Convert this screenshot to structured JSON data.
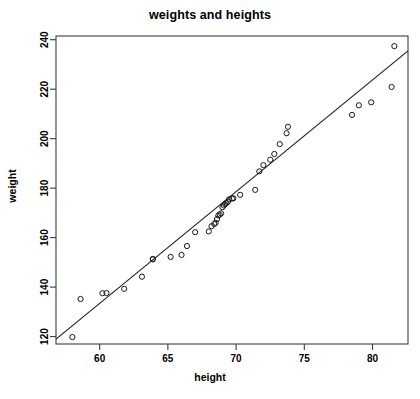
{
  "chart_data": {
    "type": "scatter",
    "title": "weights and heights",
    "xlabel": "height",
    "ylabel": "weight",
    "xlim": [
      56.8,
      82.6
    ],
    "ylim": [
      117.0,
      241.5
    ],
    "xticks": [
      60,
      65,
      70,
      75,
      80
    ],
    "xtick_labels": [
      "60",
      "65",
      "70",
      "75",
      "80"
    ],
    "yticks": [
      120,
      140,
      160,
      180,
      200,
      220,
      240
    ],
    "ytick_labels": [
      "120",
      "140",
      "160",
      "180",
      "200",
      "220",
      "240"
    ],
    "grid": false,
    "legend": null,
    "point_marker": "open-circle",
    "x": [
      58.0,
      58.6,
      60.2,
      60.5,
      61.8,
      63.1,
      63.9,
      63.9,
      65.2,
      66.0,
      66.4,
      67.0,
      68.0,
      68.2,
      68.4,
      68.5,
      68.6,
      68.7,
      68.8,
      68.9,
      69.0,
      69.1,
      69.2,
      69.3,
      69.4,
      69.5,
      69.7,
      69.8,
      70.3,
      71.4,
      71.7,
      72.0,
      72.5,
      72.8,
      73.2,
      73.7,
      73.8,
      78.5,
      79.0,
      79.9,
      81.4,
      81.6
    ],
    "y": [
      119.8,
      135.2,
      137.5,
      137.6,
      139.3,
      144.2,
      151.2,
      151.4,
      152.2,
      153.0,
      156.6,
      162.2,
      162.5,
      164.6,
      165.5,
      166.0,
      167.5,
      169.0,
      169.3,
      169.8,
      172.3,
      173.0,
      173.5,
      174.0,
      174.5,
      175.5,
      175.8,
      175.9,
      177.3,
      179.3,
      186.8,
      189.3,
      191.5,
      193.8,
      197.8,
      202.2,
      204.8,
      209.6,
      213.5,
      214.7,
      220.9,
      237.4
    ],
    "regression_line": {
      "x1": 56.8,
      "y1": 119.0,
      "x2": 82.6,
      "y2": 235.5,
      "slope": 4.516,
      "intercept": -137.5
    },
    "series_name": "weights vs heights"
  },
  "plot": {
    "frame_color": "#3c3c3c",
    "point_color": "#1a1a1a",
    "line_color": "#1a1a1a",
    "background": "#ffffff"
  }
}
